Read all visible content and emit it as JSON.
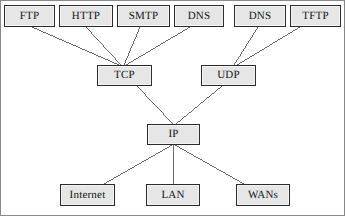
{
  "figure": {
    "width": 346,
    "height": 217,
    "background": "#ffffff",
    "frame_color": "#8a8a8a",
    "node_fill": "#e6e6e6",
    "node_border": "#2b2b2b",
    "edge_color": "#5a5a5a",
    "text_color": "#151515"
  },
  "nodes": [
    {
      "id": "ftp",
      "label": "FTP",
      "layer": "application",
      "x": 4,
      "y": 5,
      "w": 51,
      "h": 22
    },
    {
      "id": "http",
      "label": "HTTP",
      "layer": "application",
      "x": 59,
      "y": 5,
      "w": 54,
      "h": 22
    },
    {
      "id": "smtp",
      "label": "SMTP",
      "layer": "application",
      "x": 117,
      "y": 5,
      "w": 53,
      "h": 22
    },
    {
      "id": "dns_tcp",
      "label": "DNS",
      "layer": "application",
      "x": 174,
      "y": 5,
      "w": 50,
      "h": 22
    },
    {
      "id": "dns_udp",
      "label": "DNS",
      "layer": "application",
      "x": 234,
      "y": 5,
      "w": 52,
      "h": 22
    },
    {
      "id": "tftp",
      "label": "TFTP",
      "layer": "application",
      "x": 290,
      "y": 5,
      "w": 51,
      "h": 22
    },
    {
      "id": "tcp",
      "label": "TCP",
      "layer": "transport",
      "x": 97,
      "y": 65,
      "w": 55,
      "h": 21
    },
    {
      "id": "udp",
      "label": "UDP",
      "layer": "transport",
      "x": 201,
      "y": 65,
      "w": 55,
      "h": 21
    },
    {
      "id": "ip",
      "label": "IP",
      "layer": "internet",
      "x": 147,
      "y": 124,
      "w": 53,
      "h": 21
    },
    {
      "id": "internet",
      "label": "Internet",
      "layer": "network",
      "x": 60,
      "y": 184,
      "w": 55,
      "h": 22
    },
    {
      "id": "lan",
      "label": "LAN",
      "layer": "network",
      "x": 146,
      "y": 184,
      "w": 54,
      "h": 22
    },
    {
      "id": "wans",
      "label": "WANs",
      "layer": "network",
      "x": 236,
      "y": 184,
      "w": 54,
      "h": 22
    }
  ],
  "edges": [
    {
      "id": "ftp-tcp",
      "from": "ftp",
      "to": "tcp",
      "x1": 32,
      "y1": 27,
      "x2": 119,
      "y2": 65
    },
    {
      "id": "http-tcp",
      "from": "http",
      "to": "tcp",
      "x1": 86,
      "y1": 27,
      "x2": 121,
      "y2": 65
    },
    {
      "id": "smtp-tcp",
      "from": "smtp",
      "to": "tcp",
      "x1": 140,
      "y1": 27,
      "x2": 124,
      "y2": 65
    },
    {
      "id": "dns-tcp",
      "from": "dns_tcp",
      "to": "tcp",
      "x1": 190,
      "y1": 27,
      "x2": 126,
      "y2": 65
    },
    {
      "id": "dns-udp",
      "from": "dns_udp",
      "to": "udp",
      "x1": 258,
      "y1": 27,
      "x2": 234,
      "y2": 65
    },
    {
      "id": "tftp-udp",
      "from": "tftp",
      "to": "udp",
      "x1": 300,
      "y1": 27,
      "x2": 237,
      "y2": 65
    },
    {
      "id": "tcp-ip",
      "from": "tcp",
      "to": "ip",
      "x1": 137,
      "y1": 86,
      "x2": 173,
      "y2": 124
    },
    {
      "id": "udp-ip",
      "from": "udp",
      "to": "ip",
      "x1": 222,
      "y1": 86,
      "x2": 176,
      "y2": 124
    },
    {
      "id": "ip-internet",
      "from": "ip",
      "to": "internet",
      "x1": 172,
      "y1": 145,
      "x2": 104,
      "y2": 184
    },
    {
      "id": "ip-lan",
      "from": "ip",
      "to": "lan",
      "x1": 173,
      "y1": 145,
      "x2": 173,
      "y2": 184
    },
    {
      "id": "ip-wans",
      "from": "ip",
      "to": "wans",
      "x1": 175,
      "y1": 145,
      "x2": 244,
      "y2": 184
    }
  ]
}
